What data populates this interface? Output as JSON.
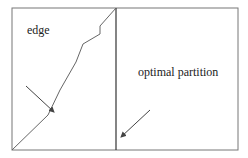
{
  "diagram": {
    "labels": {
      "edge": "edge",
      "partition": "optimal partition"
    },
    "frame": {
      "x": 12,
      "y": 8,
      "width": 226,
      "height": 142
    },
    "partition_x": 116,
    "edge_path": [
      [
        12,
        150
      ],
      [
        48,
        115
      ],
      [
        60,
        90
      ],
      [
        76,
        62
      ],
      [
        83,
        44
      ],
      [
        100,
        34
      ],
      [
        100,
        26
      ],
      [
        116,
        8
      ]
    ],
    "arrows": [
      {
        "from": [
          26,
          86
        ],
        "to": [
          54,
          112
        ],
        "points_to": "edge"
      },
      {
        "from": [
          150,
          110
        ],
        "to": [
          120,
          138
        ],
        "points_to": "optimal partition"
      }
    ],
    "colors": {
      "stroke": "#555555",
      "text": "#222222"
    }
  }
}
